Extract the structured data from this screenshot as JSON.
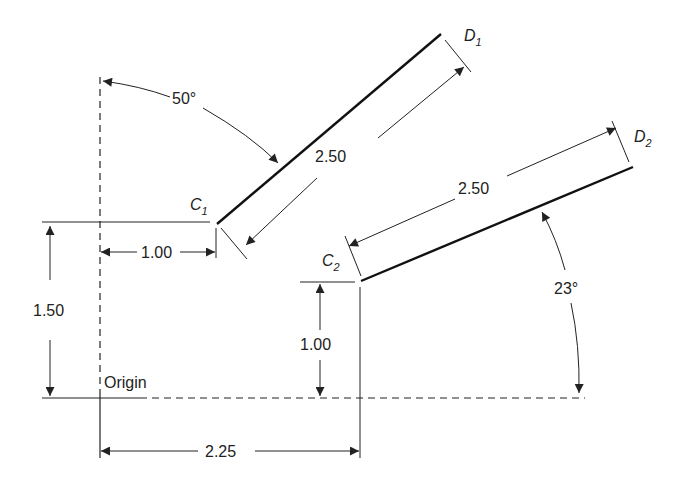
{
  "diagram": {
    "type": "engineering-dimension-drawing",
    "origin_label": "Origin",
    "points": {
      "C1": {
        "label": "C",
        "sub": "1"
      },
      "D1": {
        "label": "D",
        "sub": "1"
      },
      "C2": {
        "label": "C",
        "sub": "2"
      },
      "D2": {
        "label": "D",
        "sub": "2"
      }
    },
    "dimensions": {
      "c1_dx": "1.00",
      "c1_dy": "1.50",
      "c2_dx": "2.25",
      "c2_dy": "1.00",
      "seg1_length": "2.50",
      "seg2_length": "2.50",
      "angle1": "50°",
      "angle2": "23°"
    },
    "colors": {
      "ink": "#222222",
      "background": "#ffffff"
    }
  }
}
